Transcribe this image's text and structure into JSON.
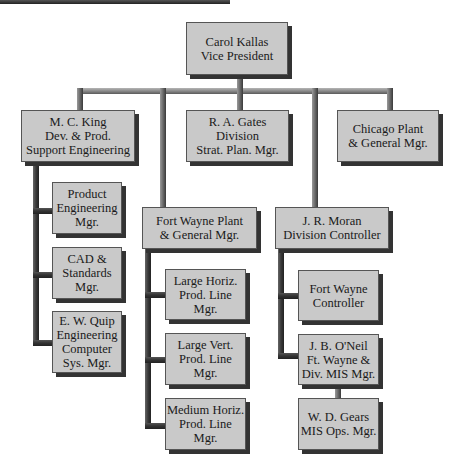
{
  "chart": {
    "nodes": {
      "vp": {
        "lines": [
          "Carol Kallas",
          "Vice President"
        ]
      },
      "king": {
        "lines": [
          "M. C. King",
          "Dev. & Prod.",
          "Support Engineering"
        ]
      },
      "gates": {
        "lines": [
          "R. A. Gates",
          "Division",
          "Strat. Plan. Mgr."
        ]
      },
      "chicago": {
        "lines": [
          "Chicago Plant",
          "& General Mgr."
        ]
      },
      "product_eng": {
        "lines": [
          "Product",
          "Engineering",
          "Mgr."
        ]
      },
      "cad": {
        "lines": [
          "CAD &",
          "Standards",
          "Mgr."
        ]
      },
      "quip": {
        "lines": [
          "E. W. Quip",
          "Engineering",
          "Computer",
          "Sys. Mgr."
        ]
      },
      "fort_wayne_plant": {
        "lines": [
          "Fort Wayne Plant",
          "& General Mgr."
        ]
      },
      "large_horiz": {
        "lines": [
          "Large Horiz.",
          "Prod. Line",
          "Mgr."
        ]
      },
      "large_vert": {
        "lines": [
          "Large Vert.",
          "Prod. Line",
          "Mgr."
        ]
      },
      "medium_horiz": {
        "lines": [
          "Medium Horiz.",
          "Prod. Line",
          "Mgr."
        ]
      },
      "moran": {
        "lines": [
          "J. R. Moran",
          "Division Controller"
        ]
      },
      "fw_controller": {
        "lines": [
          "Fort Wayne",
          "Controller"
        ]
      },
      "oneil": {
        "lines": [
          "J. B. O'Neil",
          "Ft. Wayne &",
          "Div. MIS Mgr."
        ]
      },
      "gears": {
        "lines": [
          "W. D. Gears",
          "MIS Ops. Mgr."
        ]
      }
    },
    "edges": [
      [
        "vp",
        "king"
      ],
      [
        "vp",
        "gates"
      ],
      [
        "vp",
        "chicago"
      ],
      [
        "vp",
        "fort_wayne_plant"
      ],
      [
        "vp",
        "moran"
      ],
      [
        "king",
        "product_eng"
      ],
      [
        "king",
        "cad"
      ],
      [
        "king",
        "quip"
      ],
      [
        "fort_wayne_plant",
        "large_horiz"
      ],
      [
        "fort_wayne_plant",
        "large_vert"
      ],
      [
        "fort_wayne_plant",
        "medium_horiz"
      ],
      [
        "moran",
        "fw_controller"
      ],
      [
        "moran",
        "oneil"
      ],
      [
        "oneil",
        "gears"
      ]
    ],
    "colors": {
      "box_fill": "#c9c9c9",
      "box_shadow": "#333333",
      "connector": "#7a7a7a"
    }
  }
}
